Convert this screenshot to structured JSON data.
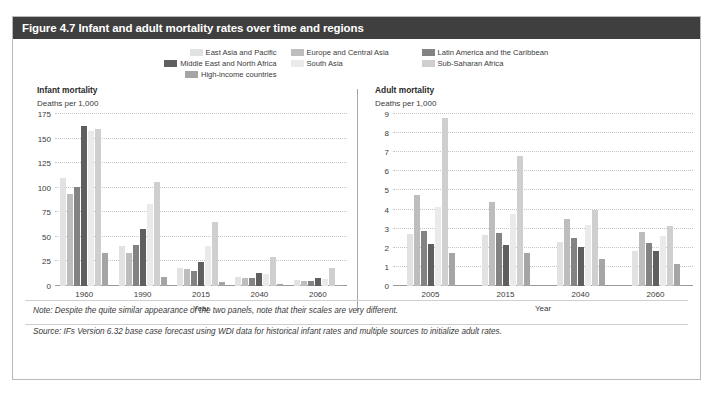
{
  "figure": {
    "title": "Figure 4.7 Infant and adult mortality rates over time and regions",
    "title_bg": "#3f3f3f",
    "note": "Note: Despite the quite similar appearance of the two panels, note that their scales are very different.",
    "source": "Source: IFs Version 6.32 base case forecast using WDI data for historical infant rates and multiple sources to initialize adult rates."
  },
  "legend": {
    "items": [
      {
        "label": "East Asia and Pacific",
        "color": "#e2e2e2"
      },
      {
        "label": "Europe and Central Asia",
        "color": "#bdbdbd"
      },
      {
        "label": "Latin America and the Caribbean",
        "color": "#838383"
      },
      {
        "label": "Middle East and North Africa",
        "color": "#5f5f5f"
      },
      {
        "label": "South Asia",
        "color": "#eaeaea"
      },
      {
        "label": "Sub-Saharan Africa",
        "color": "#cfcfcf"
      },
      {
        "label": "High-income countries",
        "color": "#a5a5a5"
      }
    ]
  },
  "chart_data": [
    {
      "type": "bar",
      "title": "Infant mortality",
      "subtitle": "Deaths per 1,000",
      "xlabel": "Year",
      "ylabel": "Deaths per 1,000",
      "categories": [
        "1960",
        "1990",
        "2015",
        "2040",
        "2060"
      ],
      "yticks": [
        0,
        25,
        50,
        75,
        100,
        125,
        150,
        175
      ],
      "ylim": [
        0,
        175
      ],
      "grid": true,
      "legend_position": "top",
      "series": [
        {
          "name": "East Asia and Pacific",
          "color": "#e2e2e2",
          "values": [
            110,
            41,
            18,
            9,
            6
          ]
        },
        {
          "name": "Europe and Central Asia",
          "color": "#bdbdbd",
          "values": [
            94,
            34,
            17,
            8,
            5
          ]
        },
        {
          "name": "Latin America and the Caribbean",
          "color": "#838383",
          "values": [
            101,
            42,
            15,
            8,
            5
          ]
        },
        {
          "name": "Middle East and North Africa",
          "color": "#5f5f5f",
          "values": [
            163,
            58,
            24,
            13,
            8
          ]
        },
        {
          "name": "South Asia",
          "color": "#eaeaea",
          "values": [
            158,
            83,
            41,
            12,
            7
          ]
        },
        {
          "name": "Sub-Saharan Africa",
          "color": "#cfcfcf",
          "values": [
            160,
            106,
            65,
            30,
            18
          ]
        },
        {
          "name": "High-income countries",
          "color": "#a5a5a5",
          "values": [
            34,
            9,
            4,
            2,
            1
          ]
        }
      ]
    },
    {
      "type": "bar",
      "title": "Adult mortality",
      "subtitle": "Deaths per 1,000",
      "xlabel": "Year",
      "ylabel": "Deaths per 1,000",
      "categories": [
        "2005",
        "2015",
        "2040",
        "2060"
      ],
      "yticks": [
        0,
        1,
        2,
        3,
        4,
        5,
        6,
        7,
        8,
        9
      ],
      "ylim": [
        0,
        9
      ],
      "grid": true,
      "legend_position": "top",
      "series": [
        {
          "name": "East Asia and Pacific",
          "color": "#e2e2e2",
          "values": [
            2.7,
            2.65,
            2.3,
            1.85
          ]
        },
        {
          "name": "Europe and Central Asia",
          "color": "#bdbdbd",
          "values": [
            4.75,
            4.4,
            3.5,
            2.85
          ]
        },
        {
          "name": "Latin America and the Caribbean",
          "color": "#838383",
          "values": [
            2.9,
            2.8,
            2.5,
            2.25
          ]
        },
        {
          "name": "Middle East and North Africa",
          "color": "#5f5f5f",
          "values": [
            2.2,
            2.15,
            2.05,
            1.85
          ]
        },
        {
          "name": "South Asia",
          "color": "#eaeaea",
          "values": [
            4.15,
            3.75,
            3.2,
            2.6
          ]
        },
        {
          "name": "Sub-Saharan Africa",
          "color": "#cfcfcf",
          "values": [
            8.8,
            6.8,
            4.0,
            3.15
          ]
        },
        {
          "name": "High-income countries",
          "color": "#a5a5a5",
          "values": [
            1.75,
            1.75,
            1.4,
            1.15
          ]
        }
      ]
    }
  ]
}
